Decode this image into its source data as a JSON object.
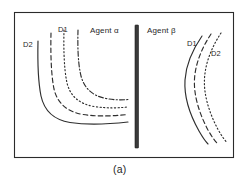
{
  "figure": {
    "caption": "(a)",
    "frame": {
      "x": 14,
      "y": 12,
      "width": 220,
      "height": 146,
      "border_color": "#2b2b2b"
    },
    "divider": {
      "x": 135,
      "y_top": 25,
      "y_bottom": 148,
      "width": 3.5,
      "color": "#3a3a3a"
    },
    "panels": [
      {
        "name": "agent-alpha-panel",
        "agent_label": "Agent α",
        "curve_family_labels": {
          "outer": "D2",
          "inner": "D1"
        },
        "curve_count": 4,
        "curve_shape": "L-shaped indifference curves convex toward lower-left origin",
        "curves": [
          {
            "id": "alpha-curve-1",
            "style": "solid",
            "label": "D2"
          },
          {
            "id": "alpha-curve-2",
            "style": "dashed",
            "label": ""
          },
          {
            "id": "alpha-curve-3",
            "style": "dotted",
            "label": ""
          },
          {
            "id": "alpha-curve-4",
            "style": "dashdot",
            "label": "D1"
          }
        ]
      },
      {
        "name": "agent-beta-panel",
        "agent_label": "Agent β",
        "curve_family_labels": {
          "outer": "D1",
          "inner": "D2"
        },
        "curve_count": 3,
        "curve_shape": "Vertically elongated curves bowing leftward",
        "curves": [
          {
            "id": "beta-curve-1",
            "style": "solid",
            "label": "D1"
          },
          {
            "id": "beta-curve-2",
            "style": "dashed",
            "label": ""
          },
          {
            "id": "beta-curve-3",
            "style": "dotted",
            "label": "D2"
          }
        ]
      }
    ],
    "labels": {
      "d1_left": "D1",
      "d2_left": "D2",
      "agent_alpha": "Agent α",
      "agent_beta": "Agent β",
      "d1_right": "D1",
      "d2_right": "D2"
    },
    "colors": {
      "ink": "#2e2e2e",
      "frame": "#2b2b2b",
      "divider": "#3a3a3a",
      "background": "#ffffff"
    }
  }
}
